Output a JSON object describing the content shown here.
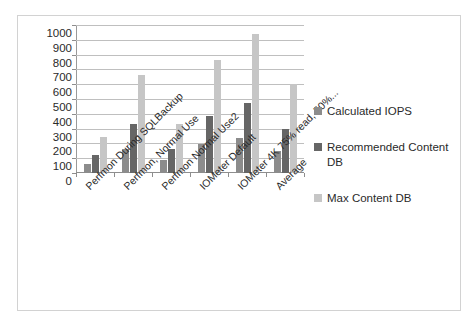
{
  "chart_data": {
    "type": "bar",
    "title": "",
    "subtitle": "",
    "xlabel": "",
    "ylabel": "",
    "ylim": [
      0,
      1000
    ],
    "ytick_step": 100,
    "yticks": [
      "1000",
      "900",
      "800",
      "700",
      "600",
      "500",
      "400",
      "300",
      "200",
      "100",
      "0"
    ],
    "grid": true,
    "legend_position": "right",
    "categories": [
      "Perfmon During SQLBackup",
      "Perfmon, Normal Use",
      "Perfmon Normal Use2",
      "IOMeter Default",
      "IOMeter 4K 75% read, 50%...",
      "Average"
    ],
    "series": [
      {
        "name": "Calculated IOPS",
        "color": "#8c8c8c",
        "values": [
          60,
          165,
          85,
          195,
          235,
          148
        ]
      },
      {
        "name": "Recommended Content DB",
        "color": "#666666",
        "values": [
          120,
          330,
          165,
          385,
          470,
          295
        ]
      },
      {
        "name": "Max Content DB",
        "color": "#c6c6c6",
        "values": [
          245,
          665,
          330,
          765,
          940,
          600
        ]
      }
    ]
  },
  "legend": {
    "items": [
      {
        "label": "Calculated IOPS"
      },
      {
        "label": "Recommended Content DB"
      },
      {
        "label": "Max Content DB"
      }
    ]
  },
  "frame": {
    "border_color": "#d2d2d2",
    "background": "#ffffff"
  }
}
